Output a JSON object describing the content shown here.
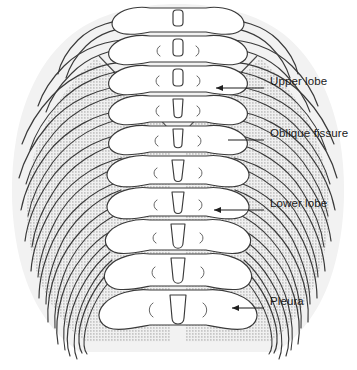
{
  "figure": {
    "view": "posterior",
    "background_color": "#ffffff",
    "line_color": "#3a3a3a",
    "upper_lobe_fill": "#f2f2f2",
    "lower_lobe_fill": "#e4e4e4",
    "bone_fill": "#ffffff",
    "stipple_color": "#8c8c8c"
  },
  "labels": [
    {
      "id": "upper-lobe",
      "text": "Upper lobe",
      "text_x": 270,
      "text_y": 83,
      "leader_x1": 264,
      "leader_y1": 88,
      "leader_x2": 216,
      "leader_y2": 88,
      "arrow": true
    },
    {
      "id": "oblique-fissure",
      "text": "Oblique fissure",
      "text_x": 270,
      "text_y": 135,
      "leader_x1": 264,
      "leader_y1": 140,
      "leader_x2": 228,
      "leader_y2": 140,
      "arrow": false
    },
    {
      "id": "lower-lobe",
      "text": "Lower lobe",
      "text_x": 270,
      "text_y": 205,
      "leader_x1": 264,
      "leader_y1": 210,
      "leader_x2": 214,
      "leader_y2": 210,
      "arrow": true
    },
    {
      "id": "pleura",
      "text": "Pleura",
      "text_x": 270,
      "text_y": 303,
      "leader_x1": 264,
      "leader_y1": 308,
      "leader_x2": 232,
      "leader_y2": 308,
      "arrow": true
    }
  ],
  "anatomy": {
    "rib_pairs": 12,
    "vertebrae_count": 17,
    "regions": [
      {
        "name": "upper-lobe-region",
        "texture": "plain-gray"
      },
      {
        "name": "lower-lobe-region",
        "texture": "stippled"
      },
      {
        "name": "vertebral-column",
        "texture": "outline"
      },
      {
        "name": "rib-cage",
        "texture": "outline"
      }
    ]
  }
}
